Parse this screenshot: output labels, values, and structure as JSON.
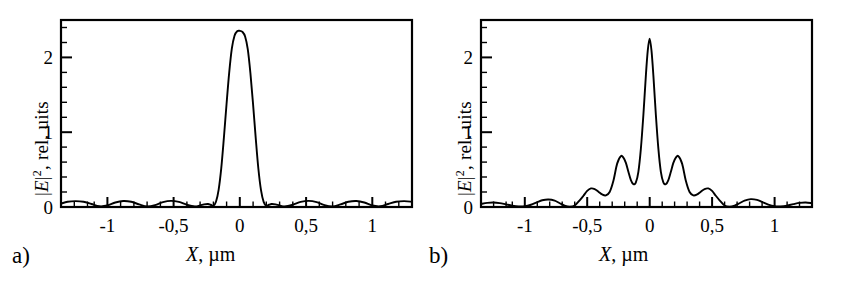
{
  "figure": {
    "background": "#ffffff",
    "line_color": "#000000",
    "axis_color": "#000000"
  },
  "panels": [
    {
      "tag": "a)",
      "ylabel_pre": "|",
      "ylabel_ital": "E",
      "ylabel_sup": "2",
      "ylabel_post": ", rel. uits",
      "ylabel_full": "|E|2, rel. uits",
      "xlabel_ital": "X",
      "xlabel_rest": ", µm",
      "xlabel_full": "X, µm",
      "ytick_labels": [
        "0",
        "1",
        "2"
      ],
      "xtick_labels": [
        "-1",
        "-0,5",
        "0",
        "0,5",
        "1"
      ]
    },
    {
      "tag": "b)",
      "ylabel_pre": "|",
      "ylabel_ital": "E",
      "ylabel_sup": "2",
      "ylabel_post": ", rel. uits",
      "ylabel_full": "|E|2, rel. uits",
      "xlabel_ital": "X",
      "xlabel_rest": ", µm",
      "xlabel_full": "X, µm",
      "ytick_labels": [
        "0",
        "1",
        "2"
      ],
      "xtick_labels": [
        "-1",
        "-0,5",
        "0",
        "0,5",
        "1"
      ]
    }
  ],
  "chart_data": [
    {
      "type": "line",
      "panel": "a)",
      "title": "",
      "xlabel": "X, µm",
      "ylabel": "|E|2, rel. uits",
      "xlim": [
        -1.35,
        1.3
      ],
      "ylim": [
        0,
        2.5
      ],
      "xticks": [
        -1,
        -0.5,
        0,
        0.5,
        1
      ],
      "xtick_labels": [
        "-1",
        "-0,5",
        "0",
        "0,5",
        "1"
      ],
      "yticks": [
        0,
        1,
        2
      ],
      "ytick_labels": [
        "0",
        "1",
        "2"
      ],
      "minor_xticks": 5,
      "minor_yticks": 5,
      "grid": false,
      "legend": false,
      "peak_value": 2.35,
      "peak_position": 0.0,
      "series": [
        {
          "name": "|E|^2 single slit focus",
          "x": [
            -1.35,
            -1.3,
            -1.24,
            -1.18,
            -1.12,
            -1.06,
            -1.0,
            -0.94,
            -0.88,
            -0.82,
            -0.76,
            -0.7,
            -0.64,
            -0.58,
            -0.52,
            -0.46,
            -0.4,
            -0.34,
            -0.3,
            -0.27,
            -0.24,
            -0.22,
            -0.2,
            -0.18,
            -0.16,
            -0.14,
            -0.12,
            -0.1,
            -0.08,
            -0.06,
            -0.04,
            -0.02,
            0.0,
            0.02,
            0.04,
            0.06,
            0.08,
            0.1,
            0.12,
            0.14,
            0.16,
            0.18,
            0.2,
            0.22,
            0.24,
            0.27,
            0.3,
            0.34,
            0.4,
            0.46,
            0.52,
            0.58,
            0.64,
            0.7,
            0.76,
            0.82,
            0.88,
            0.94,
            1.0,
            1.06,
            1.12,
            1.18,
            1.24,
            1.3
          ],
          "y": [
            0.045,
            0.07,
            0.078,
            0.07,
            0.04,
            0.01,
            0.02,
            0.06,
            0.08,
            0.07,
            0.035,
            0.008,
            0.025,
            0.065,
            0.082,
            0.068,
            0.03,
            0.006,
            0.02,
            0.035,
            0.04,
            0.03,
            0.015,
            0.07,
            0.23,
            0.52,
            0.93,
            1.38,
            1.8,
            2.12,
            2.29,
            2.35,
            2.355,
            2.34,
            2.28,
            2.11,
            1.79,
            1.375,
            0.925,
            0.515,
            0.225,
            0.068,
            0.015,
            0.03,
            0.04,
            0.035,
            0.02,
            0.006,
            0.03,
            0.068,
            0.082,
            0.065,
            0.025,
            0.008,
            0.035,
            0.07,
            0.08,
            0.06,
            0.02,
            0.01,
            0.04,
            0.07,
            0.078,
            0.07
          ]
        }
      ]
    },
    {
      "type": "line",
      "panel": "b)",
      "title": "",
      "xlabel": "X, µm",
      "ylabel": "|E|2, rel. uits",
      "xlim": [
        -1.35,
        1.3
      ],
      "ylim": [
        0,
        2.5
      ],
      "xticks": [
        -1,
        -0.5,
        0,
        0.5,
        1
      ],
      "xtick_labels": [
        "-1",
        "-0,5",
        "0",
        "0,5",
        "1"
      ],
      "yticks": [
        0,
        1,
        2
      ],
      "ytick_labels": [
        "0",
        "1",
        "2"
      ],
      "minor_xticks": 5,
      "minor_yticks": 5,
      "grid": false,
      "legend": false,
      "peak_value": 2.25,
      "peak_position": 0.0,
      "side_peaks": [
        {
          "x": -0.26,
          "y": 0.68
        },
        {
          "x": 0.26,
          "y": 0.68
        },
        {
          "x": -0.5,
          "y": 0.25
        },
        {
          "x": 0.5,
          "y": 0.25
        },
        {
          "x": -0.81,
          "y": 0.1
        },
        {
          "x": 0.81,
          "y": 0.11
        }
      ],
      "series": [
        {
          "name": "|E|^2 multi-lobe focus",
          "x": [
            -1.35,
            -1.3,
            -1.25,
            -1.2,
            -1.15,
            -1.1,
            -1.05,
            -1.0,
            -0.95,
            -0.9,
            -0.86,
            -0.81,
            -0.76,
            -0.72,
            -0.68,
            -0.64,
            -0.6,
            -0.56,
            -0.53,
            -0.5,
            -0.47,
            -0.44,
            -0.41,
            -0.38,
            -0.35,
            -0.32,
            -0.29,
            -0.26,
            -0.23,
            -0.21,
            -0.19,
            -0.17,
            -0.15,
            -0.13,
            -0.11,
            -0.09,
            -0.07,
            -0.05,
            -0.03,
            -0.015,
            0.0,
            0.015,
            0.03,
            0.05,
            0.07,
            0.09,
            0.11,
            0.13,
            0.15,
            0.17,
            0.19,
            0.21,
            0.23,
            0.26,
            0.29,
            0.32,
            0.35,
            0.38,
            0.41,
            0.44,
            0.47,
            0.5,
            0.53,
            0.56,
            0.6,
            0.64,
            0.68,
            0.72,
            0.76,
            0.81,
            0.86,
            0.9,
            0.95,
            1.0,
            1.05,
            1.1,
            1.15,
            1.2,
            1.25,
            1.3
          ],
          "y": [
            0.04,
            0.055,
            0.06,
            0.052,
            0.035,
            0.018,
            0.008,
            0.01,
            0.03,
            0.065,
            0.09,
            0.1,
            0.085,
            0.05,
            0.018,
            0.005,
            0.02,
            0.09,
            0.15,
            0.215,
            0.248,
            0.24,
            0.205,
            0.168,
            0.155,
            0.2,
            0.35,
            0.58,
            0.68,
            0.66,
            0.59,
            0.47,
            0.36,
            0.305,
            0.33,
            0.47,
            0.78,
            1.23,
            1.76,
            2.09,
            2.25,
            2.09,
            1.76,
            1.23,
            0.78,
            0.47,
            0.33,
            0.305,
            0.36,
            0.47,
            0.59,
            0.66,
            0.68,
            0.58,
            0.35,
            0.2,
            0.155,
            0.168,
            0.205,
            0.24,
            0.248,
            0.215,
            0.15,
            0.09,
            0.02,
            0.005,
            0.018,
            0.05,
            0.085,
            0.105,
            0.095,
            0.068,
            0.032,
            0.01,
            0.008,
            0.018,
            0.038,
            0.055,
            0.06,
            0.052
          ]
        }
      ]
    }
  ]
}
